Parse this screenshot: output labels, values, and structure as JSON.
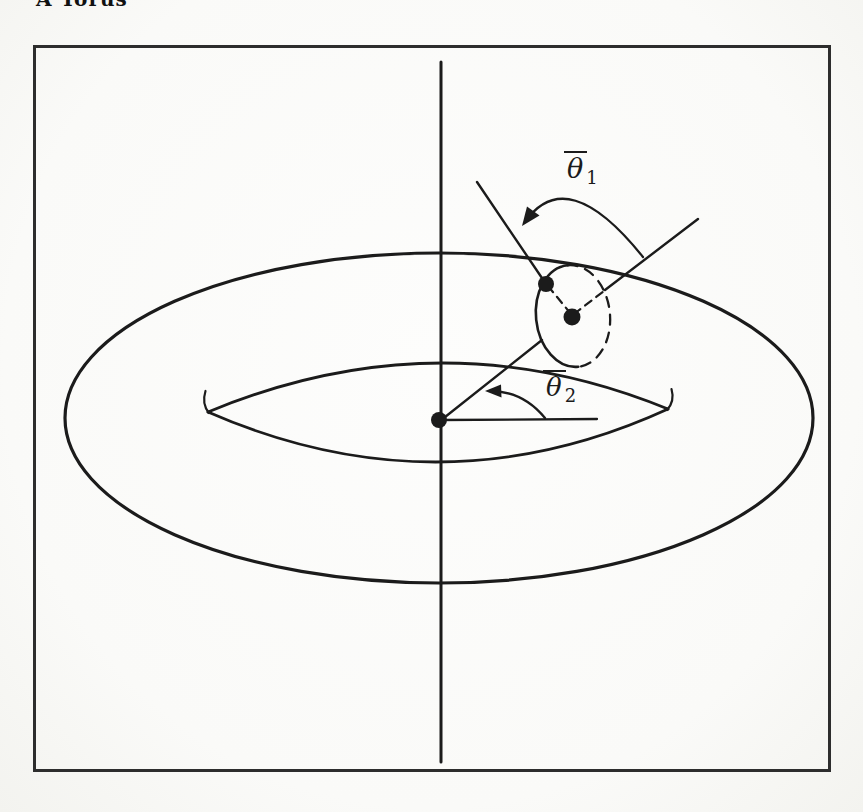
{
  "title": "A Torus",
  "figure": {
    "theta1": {
      "symbol": "θ",
      "subscript": "1"
    },
    "theta2": {
      "symbol": "θ",
      "subscript": "2"
    }
  },
  "colors": {
    "ink": "#1b1b1b",
    "paper": "#fafaf8",
    "frame_border": "#2d2d2d"
  }
}
